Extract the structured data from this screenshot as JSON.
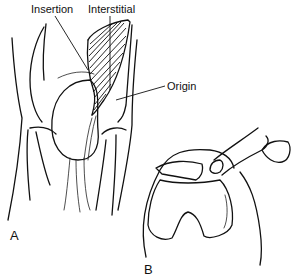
{
  "figure": {
    "panel_a": {
      "label": "A",
      "annotations": {
        "insertion": "Insertion",
        "interstitial": "Interstitial",
        "origin": "Origin"
      }
    },
    "panel_b": {
      "label": "B"
    }
  }
}
